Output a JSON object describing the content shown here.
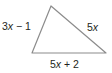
{
  "diagram": {
    "type": "triangle",
    "stroke_color": "#8c8c8c",
    "fill_color": "#ffffff",
    "vertices": {
      "top": [
        51,
        6
      ],
      "bottom_left": [
        32,
        53
      ],
      "bottom_right": [
        106,
        53
      ]
    },
    "sides": {
      "left": {
        "coef": "3",
        "var": "x",
        "rest": " − 1"
      },
      "right": {
        "coef": "5",
        "var": "x",
        "rest": ""
      },
      "bottom": {
        "coef": "5",
        "var": "x",
        "rest": " + 2"
      }
    }
  }
}
